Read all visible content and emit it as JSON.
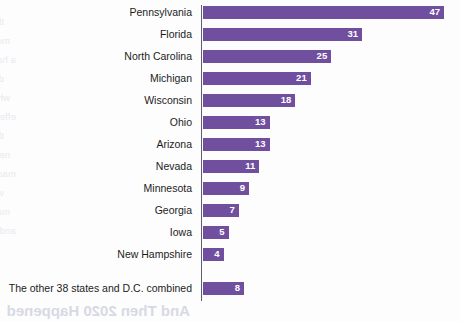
{
  "chart_data": {
    "type": "bar",
    "orientation": "horizontal",
    "title": "",
    "subtitle": "",
    "xlabel": "",
    "ylabel": "",
    "grid": false,
    "legend": null,
    "axis_line": "vertical-left",
    "value_label_position": "inside-end",
    "xlim": [
      0,
      47
    ],
    "categories": [
      "Pennsylvania",
      "Florida",
      "North Carolina",
      "Michigan",
      "Wisconsin",
      "Ohio",
      "Arizona",
      "Nevada",
      "Minnesota",
      "Georgia",
      "Iowa",
      "New Hampshire",
      "The other 38 states and D.C. combined"
    ],
    "values": [
      47,
      31,
      25,
      21,
      18,
      13,
      13,
      11,
      9,
      7,
      5,
      4,
      8
    ],
    "colors": {
      "bar": "#70509e",
      "value_text": "#ffffff",
      "category_text": "#1c1c1c",
      "axis": "#5d5f6b",
      "background": "#fdfdfd"
    }
  },
  "page_bleed": {
    "title": "And Then 2020 Happened",
    "lines": [
      "the candidates spent their time and",
      "money in the final weeks of the race",
      "a handful of battleground states",
      "decided the outcome of the election",
      "while most of the country was",
      "effectively ignored by both campaigns",
      "the electoral college map shaped",
      "nearly every strategic decision",
      "made during the general election",
      "visits were concentrated where the",
      "margins were expected to be close",
      "and the rest of the map went unvisited"
    ]
  }
}
